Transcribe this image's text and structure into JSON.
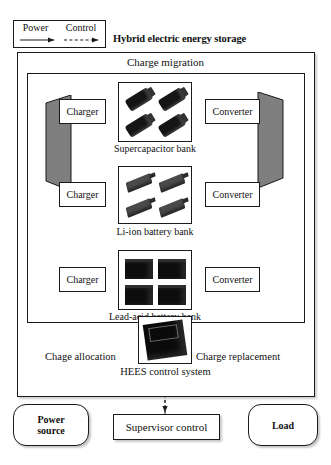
{
  "legend": {
    "power_label": "Power",
    "control_label": "Control",
    "power_icon": "solid-arrow-icon",
    "control_icon": "dashed-arrow-icon"
  },
  "title": "Hybrid electric energy storage",
  "frame": {
    "charge_migration": "Charge migration"
  },
  "rows": [
    {
      "charger": "Charger",
      "converter": "Converter",
      "bank_label": "Supercapacitor bank",
      "cell_icon": "supercapacitor-icon",
      "cells": 4
    },
    {
      "charger": "Charger",
      "converter": "Converter",
      "bank_label": "Li-ion battery bank",
      "cell_icon": "liion-cell-icon",
      "cells": 4
    },
    {
      "charger": "Charger",
      "converter": "Converter",
      "bank_label": "Lead-acid battery bank",
      "cell_icon": "lead-acid-battery-icon",
      "cells": 4
    }
  ],
  "control": {
    "left_bus_label": "Chage allocation",
    "right_bus_label": "Charge replacement",
    "chip_label": "HEES control system",
    "chip_icon": "microchip-icon"
  },
  "terminals": {
    "power_source": "Power\nsource",
    "power_source_line1": "Power",
    "power_source_line2": "source",
    "supervisor": "Supervisor control",
    "load": "Load"
  },
  "colors": {
    "line": "#1a1a1a",
    "mux_fill": "#7f7f7f",
    "cell_dark": "#0d0d0d",
    "background": "#ffffff"
  }
}
